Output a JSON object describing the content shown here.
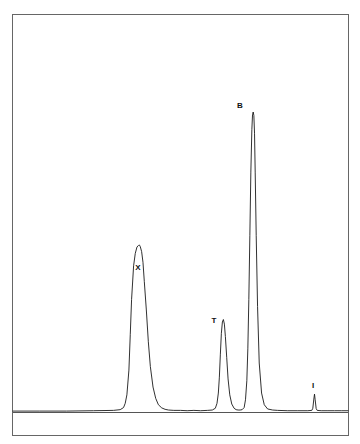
{
  "figure": {
    "background_color": "#ffffff",
    "trace_color": "#1a1a1a",
    "frame_color": "#555555",
    "label_color": "#111111"
  },
  "chart_data": {
    "type": "line",
    "title": "",
    "subtitle": "",
    "xlabel": "",
    "ylabel": "",
    "xlim": [
      0,
      100
    ],
    "ylim": [
      0,
      100
    ],
    "grid": false,
    "legend": "none",
    "axis_ticks_visible": false,
    "baseline_value": 0,
    "series": [
      {
        "name": "detector signal",
        "x": [
          0,
          8,
          16,
          24,
          30,
          32,
          33,
          33.5,
          34,
          34.6,
          35,
          35.4,
          36,
          36.5,
          37,
          37.4,
          37.6,
          37.8,
          38,
          38.4,
          38.8,
          39.2,
          39.8,
          40.4,
          41,
          41.8,
          42.6,
          43.4,
          44.4,
          45.4,
          46.4,
          48,
          50,
          52,
          54,
          56,
          58,
          59.5,
          60.4,
          60.9,
          61.3,
          61.6,
          61.9,
          62.2,
          62.5,
          62.8,
          63.1,
          63.4,
          63.8,
          64.2,
          64.7,
          65.3,
          66,
          66.6,
          67.2,
          67.8,
          68.4,
          69,
          69.4,
          69.8,
          70.1,
          70.4,
          70.7,
          71,
          71.3,
          71.5,
          71.7,
          71.9,
          72.1,
          72.3,
          72.6,
          73,
          73.5,
          74.2,
          75,
          76,
          77.5,
          79,
          82,
          85,
          88,
          89.2,
          89.5,
          89.8,
          90,
          90.2,
          90.5,
          90.8,
          92,
          94,
          96,
          98,
          100
        ],
        "y": [
          0.4,
          0.4,
          0.4,
          0.5,
          0.6,
          0.8,
          1.4,
          2.6,
          5.0,
          12.0,
          22.0,
          32.0,
          41.5,
          45.0,
          46.8,
          47.2,
          47.4,
          47.3,
          46.9,
          45.5,
          42.5,
          37.0,
          29.0,
          20.0,
          13.0,
          7.2,
          4.0,
          2.2,
          1.3,
          0.9,
          0.7,
          0.6,
          0.6,
          0.5,
          0.6,
          0.5,
          0.6,
          0.7,
          1.2,
          2.6,
          5.5,
          10.0,
          16.5,
          22.4,
          25.6,
          26.3,
          25.0,
          21.5,
          15.5,
          9.5,
          5.0,
          2.4,
          1.2,
          0.8,
          0.7,
          0.7,
          0.8,
          1.4,
          3.6,
          9.0,
          18.0,
          32.0,
          50.0,
          68.0,
          80.0,
          84.2,
          85.0,
          84.0,
          79.0,
          68.0,
          50.0,
          30.0,
          14.0,
          5.5,
          2.2,
          1.0,
          0.7,
          0.6,
          0.5,
          0.5,
          0.5,
          0.6,
          1.2,
          3.8,
          5.2,
          3.6,
          1.1,
          0.6,
          0.5,
          0.5,
          0.5,
          0.5,
          0.5
        ]
      }
    ],
    "annotations": [
      {
        "id": "peak-x",
        "label": "X",
        "x": 37.6,
        "y": 47.4,
        "height_percent": 47
      },
      {
        "id": "peak-t",
        "label": "T",
        "x": 62.8,
        "y": 26.3,
        "height_percent": 26
      },
      {
        "id": "peak-b",
        "label": "B",
        "x": 71.7,
        "y": 85.0,
        "height_percent": 85
      },
      {
        "id": "peak-i",
        "label": "I",
        "x": 89.5,
        "y": 5.2,
        "height_percent": 5
      }
    ]
  },
  "labels": {
    "peak_x": "X",
    "peak_t": "T",
    "peak_b": "B",
    "peak_i": "I"
  }
}
